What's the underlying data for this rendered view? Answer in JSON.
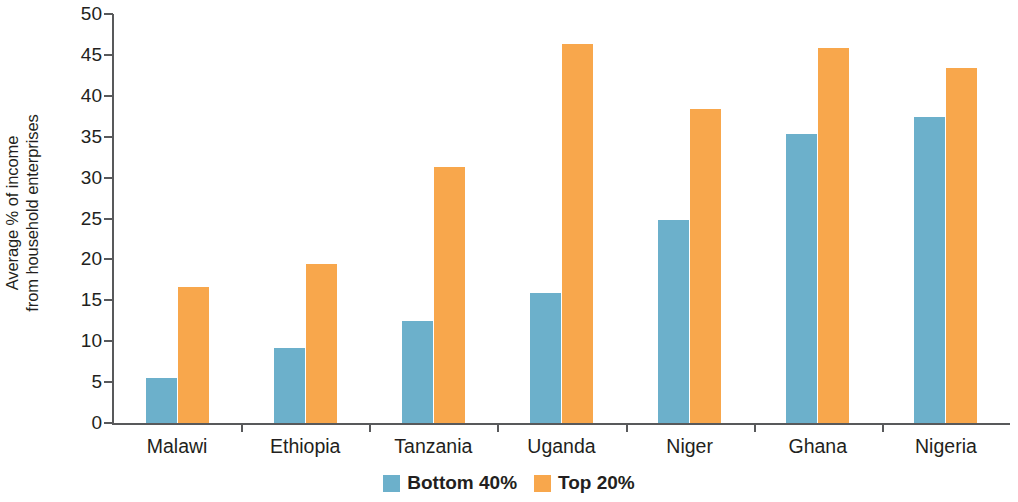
{
  "chart_data": {
    "type": "bar",
    "title": "",
    "xlabel": "",
    "ylabel": "Average % of income from household enterprises",
    "ylabel_lines": [
      "Average % of income",
      "from household enterprises"
    ],
    "categories": [
      "Malawi",
      "Ethiopia",
      "Tanzania",
      "Uganda",
      "Niger",
      "Ghana",
      "Nigeria"
    ],
    "series": [
      {
        "name": "Bottom 40%",
        "color": "#6cb0cb",
        "values": [
          5.5,
          9.2,
          12.5,
          15.9,
          24.8,
          35.3,
          37.4
        ]
      },
      {
        "name": "Top 20%",
        "color": "#f8a74c",
        "values": [
          16.6,
          19.5,
          31.3,
          46.3,
          38.4,
          45.9,
          43.4
        ]
      }
    ],
    "ylim": [
      0,
      50
    ],
    "yticks": [
      0,
      5,
      10,
      15,
      20,
      25,
      30,
      35,
      40,
      45,
      50
    ],
    "ytick_labels": [
      "0",
      "5",
      "10",
      "15",
      "20",
      "25",
      "30",
      "35",
      "40",
      "45",
      "50"
    ],
    "grid": false,
    "legend_position": "bottom-center"
  },
  "legend": {
    "items": [
      {
        "label": "Bottom 40%",
        "color": "#6cb0cb"
      },
      {
        "label": "Top 20%",
        "color": "#f8a74c"
      }
    ]
  },
  "colors": {
    "axis": "#58595b",
    "text": "#231f20",
    "background": "#ffffff",
    "bottom40": "#6cb0cb",
    "top20": "#f8a74c"
  }
}
